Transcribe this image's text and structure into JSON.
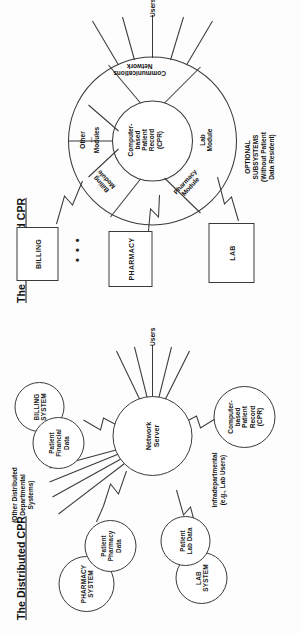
{
  "figure": {
    "kind": "two-panel-architecture-diagram",
    "orientation": "rotated-90-ccw"
  },
  "distributed": {
    "title": "The Distributed CPR",
    "hub": "Network\nServer",
    "hub_line1": "Network",
    "hub_line2": "Server",
    "nodes": [
      {
        "id": "pharmacy-system",
        "label": "PHARMACY\nSYSTEM",
        "type": "system"
      },
      {
        "id": "patient-pharmacy",
        "label": "Patient\nPharmacy\nData",
        "type": "data"
      },
      {
        "id": "billing-system",
        "label": "BILLING\nSYSTEM",
        "type": "system"
      },
      {
        "id": "patient-financial",
        "label": "Patient\nFinancial\nData",
        "type": "data"
      },
      {
        "id": "lab-system",
        "label": "LAB\nSYSTEM",
        "type": "system"
      },
      {
        "id": "patient-lab",
        "label": "Patient\nLab Data",
        "type": "data"
      },
      {
        "id": "cpr",
        "label": "Computer-\nbased\nPatient\nRecord\n(CPR)",
        "type": "data"
      }
    ],
    "annotations": {
      "other_systems": "(Other Distributed\nDepartmental\nSystems)",
      "intradepartmental": "Infradepartmental\n(e.g., Lab Users)"
    },
    "users_label": "Users",
    "users_fan_count": 5
  },
  "centralized": {
    "title": "The Centralized CPR",
    "core": "Computer-\nbased\nPatient\nRecord\n(CPR)",
    "core_lines": [
      "Computer-",
      "based",
      "Patient",
      "Record",
      "(CPR)"
    ],
    "segments": [
      {
        "id": "billing-module",
        "label": "Billing\nModule"
      },
      {
        "id": "other-modules",
        "label": "Other\n...\nModules"
      },
      {
        "id": "communications-network",
        "label": "Communications\nNetwork"
      },
      {
        "id": "lab-module",
        "label": "Lab\nModule"
      },
      {
        "id": "pharmacy-module",
        "label": "Pharmacy\nModule"
      }
    ],
    "external_boxes": [
      {
        "id": "billing-box",
        "label": "BILLING"
      },
      {
        "id": "pharmacy-box",
        "label": "PHARMACY"
      },
      {
        "id": "lab-box",
        "label": "LAB"
      }
    ],
    "ellipsis": "• • •",
    "annotations": {
      "optional_subsystems": "OPTIONAL\nSUBSYSTEMS\n(Without Patient\nData Resident)"
    },
    "users_label": "Users",
    "users_fan_count": 5
  },
  "colors": {
    "ink": "#3a3a3a",
    "text": "#111111",
    "paper": "#fdfdfd"
  }
}
